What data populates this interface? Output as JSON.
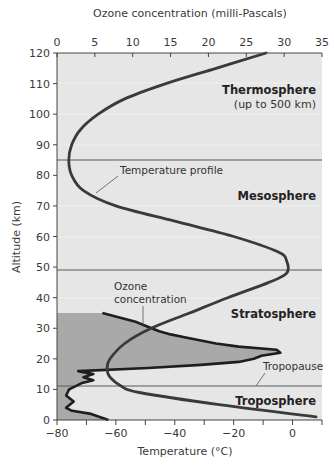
{
  "chart_data": {
    "type": "line",
    "title": "",
    "top_axis": {
      "label": "Ozone concentration (milli-Pascals)",
      "ticks": [
        0,
        5,
        10,
        15,
        20,
        25,
        30,
        35
      ],
      "range": [
        0,
        35
      ]
    },
    "bottom_axis": {
      "label": "Temperature (°C)",
      "ticks": [
        -80,
        -60,
        -40,
        -20,
        0
      ],
      "range": [
        -80,
        10
      ]
    },
    "left_axis": {
      "label": "Altitude (km)",
      "ticks": [
        0,
        10,
        20,
        30,
        40,
        50,
        60,
        70,
        80,
        90,
        100,
        110,
        120
      ],
      "range": [
        0,
        120
      ]
    },
    "series": [
      {
        "name": "Temperature profile",
        "axis": "temperature",
        "points": [
          {
            "altitude": 1,
            "value": 8
          },
          {
            "altitude": 5,
            "value": -25
          },
          {
            "altitude": 9,
            "value": -52
          },
          {
            "altitude": 11,
            "value": -58
          },
          {
            "altitude": 14,
            "value": -62
          },
          {
            "altitude": 17,
            "value": -63
          },
          {
            "altitude": 20,
            "value": -62
          },
          {
            "altitude": 25,
            "value": -57
          },
          {
            "altitude": 30,
            "value": -48
          },
          {
            "altitude": 35,
            "value": -35
          },
          {
            "altitude": 40,
            "value": -22
          },
          {
            "altitude": 45,
            "value": -8
          },
          {
            "altitude": 48,
            "value": -2
          },
          {
            "altitude": 52,
            "value": -2
          },
          {
            "altitude": 55,
            "value": -5
          },
          {
            "altitude": 60,
            "value": -20
          },
          {
            "altitude": 65,
            "value": -40
          },
          {
            "altitude": 70,
            "value": -60
          },
          {
            "altitude": 75,
            "value": -71
          },
          {
            "altitude": 80,
            "value": -75
          },
          {
            "altitude": 85,
            "value": -76
          },
          {
            "altitude": 90,
            "value": -75
          },
          {
            "altitude": 95,
            "value": -72
          },
          {
            "altitude": 100,
            "value": -66
          },
          {
            "altitude": 105,
            "value": -57
          },
          {
            "altitude": 110,
            "value": -43
          },
          {
            "altitude": 115,
            "value": -26
          },
          {
            "altitude": 120,
            "value": -9
          }
        ]
      },
      {
        "name": "Ozone concentration",
        "axis": "ozone",
        "points": [
          {
            "altitude": 0,
            "value": 6.8
          },
          {
            "altitude": 2,
            "value": 4.5
          },
          {
            "altitude": 3,
            "value": 2.0
          },
          {
            "altitude": 4,
            "value": 1.2
          },
          {
            "altitude": 6,
            "value": 2.2
          },
          {
            "altitude": 8,
            "value": 1.2
          },
          {
            "altitude": 10,
            "value": 1.6
          },
          {
            "altitude": 12,
            "value": 3.2
          },
          {
            "altitude": 13,
            "value": 4.8
          },
          {
            "altitude": 14,
            "value": 3.5
          },
          {
            "altitude": 15,
            "value": 4.8
          },
          {
            "altitude": 16,
            "value": 2.8
          },
          {
            "altitude": 17,
            "value": 12
          },
          {
            "altitude": 18,
            "value": 19
          },
          {
            "altitude": 19,
            "value": 24
          },
          {
            "altitude": 20,
            "value": 26
          },
          {
            "altitude": 21,
            "value": 27
          },
          {
            "altitude": 22,
            "value": 29.5
          },
          {
            "altitude": 23,
            "value": 29
          },
          {
            "altitude": 24,
            "value": 24
          },
          {
            "altitude": 25,
            "value": 21
          },
          {
            "altitude": 26,
            "value": 19
          },
          {
            "altitude": 27,
            "value": 17
          },
          {
            "altitude": 28,
            "value": 15
          },
          {
            "altitude": 29,
            "value": 13.5
          },
          {
            "altitude": 30,
            "value": 12.5
          },
          {
            "altitude": 31,
            "value": 11.5
          },
          {
            "altitude": 32,
            "value": 10.5
          },
          {
            "altitude": 33,
            "value": 9
          },
          {
            "altitude": 34,
            "value": 7.5
          },
          {
            "altitude": 35,
            "value": 6
          }
        ]
      }
    ],
    "boundaries": [
      {
        "name": "Tropopause",
        "altitude": 11
      },
      {
        "name": "Stratopause",
        "altitude": 49
      },
      {
        "name": "Mesopause",
        "altitude": 85
      }
    ],
    "layers": [
      {
        "name": "Troposphere",
        "range": [
          0,
          11
        ]
      },
      {
        "name": "Stratosphere",
        "range": [
          11,
          49
        ]
      },
      {
        "name": "Mesosphere",
        "range": [
          49,
          85
        ]
      },
      {
        "name": "Thermosphere",
        "range": [
          85,
          120
        ],
        "note": "(up to 500 km)"
      }
    ],
    "annotations": [
      "Temperature profile",
      "Ozone concentration",
      "Tropopause"
    ],
    "grid": false,
    "legend": "none"
  },
  "labels": {
    "top_axis_title": "Ozone concentration (milli-Pascals)",
    "bottom_axis_title": "Temperature (°C)",
    "left_axis_title": "Altitude (km)",
    "thermosphere": "Thermosphere",
    "thermosphere_note": "(up to 500 km)",
    "mesosphere": "Mesosphere",
    "stratosphere": "Stratosphere",
    "troposphere": "Troposphere",
    "temperature_profile": "Temperature profile",
    "ozone_line1": "Ozone",
    "ozone_line2": "concentration",
    "tropopause": "Tropopause"
  },
  "colors": {
    "plot_background": "#e6e6e6",
    "ozone_fill": "#a9a9a9",
    "curve": "#3a3a3a",
    "boundary_line": "#555555"
  }
}
